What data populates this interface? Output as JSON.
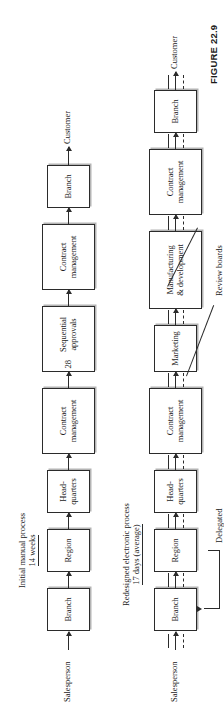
{
  "figure": {
    "caption": "FIGURE 22.9"
  },
  "colors": {
    "stroke": "#2b2b2b",
    "shadow": "#b4b4b4",
    "background": "#ffffff"
  },
  "processes": [
    {
      "id": "initial-manual-process",
      "title": "Initial manual process",
      "duration": "14 weeks",
      "start_label": "Salesperson",
      "end_label": "Customer",
      "nodes": [
        {
          "label": "Branch"
        },
        {
          "label": "Region"
        },
        {
          "label": "Head-\nquarters"
        },
        {
          "label": "Contract\nmanagement"
        },
        {
          "label": "Sequential\napprovals",
          "count": "28"
        },
        {
          "label": "Contract\nmanagement"
        },
        {
          "label": "Branch"
        }
      ]
    },
    {
      "id": "redesigned-electronic-process",
      "title": "Redesigned electronic process",
      "duration": "17 days (average)",
      "start_label": "Salesperson",
      "end_label": "Customer",
      "nodes": [
        {
          "label": "Branch"
        },
        {
          "label": "Region"
        },
        {
          "label": "Head-\nquarters"
        },
        {
          "label": "Contract\nmanagement"
        },
        {
          "label": "Marketing"
        },
        {
          "label": "Manufacturing\n& development"
        },
        {
          "label": "Contract\nmanagement"
        },
        {
          "label": "Branch"
        }
      ],
      "annotations": [
        {
          "id": "review-boards",
          "label": "Review boards"
        },
        {
          "id": "delegated",
          "label": "Delegated"
        }
      ]
    }
  ]
}
